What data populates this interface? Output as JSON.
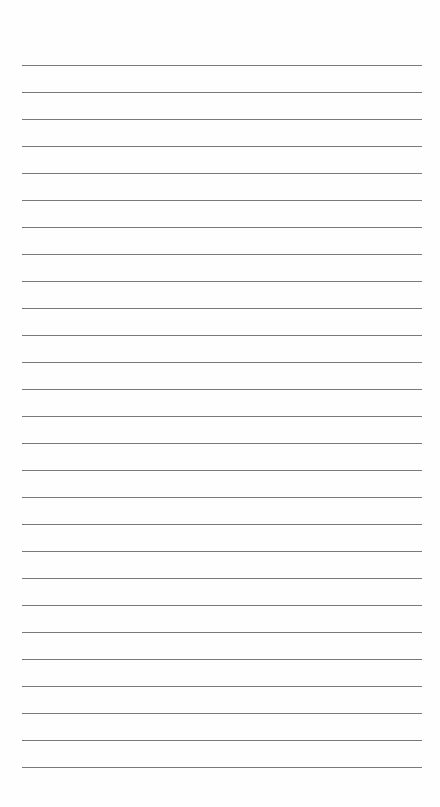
{
  "page": {
    "type": "lined-notepad",
    "background_color": "#fefefe",
    "line_color": "#7a7a7a",
    "line_count": 27,
    "first_line_y": 65,
    "line_spacing": 27,
    "line_left": 22,
    "line_width": 400,
    "text": ""
  }
}
